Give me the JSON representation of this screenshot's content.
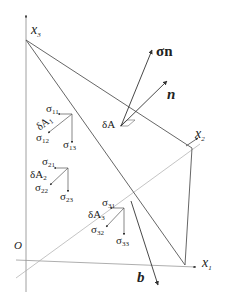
{
  "axes": {
    "x1": {
      "label": "x",
      "sub": "1"
    },
    "x2": {
      "label": "x",
      "sub": "2"
    },
    "x3": {
      "label": "x",
      "sub": "3"
    },
    "origin": "O"
  },
  "vectors": {
    "sigma_n": "σn",
    "n": "n",
    "b": "b"
  },
  "surface_element": "δA",
  "faces": [
    {
      "area": {
        "base": "δA",
        "sub": "1"
      },
      "s_a": {
        "base": "σ",
        "sub": "11"
      },
      "s_b": {
        "base": "σ",
        "sub": "12"
      },
      "s_c": {
        "base": "σ",
        "sub": "13"
      }
    },
    {
      "area": {
        "base": "δA",
        "sub": "2"
      },
      "s_a": {
        "base": "σ",
        "sub": "21"
      },
      "s_b": {
        "base": "σ",
        "sub": "22"
      },
      "s_c": {
        "base": "σ",
        "sub": "23"
      }
    },
    {
      "area": {
        "base": "δA",
        "sub": "3"
      },
      "s_a": {
        "base": "σ",
        "sub": "31"
      },
      "s_b": {
        "base": "σ",
        "sub": "32"
      },
      "s_c": {
        "base": "σ",
        "sub": "33"
      }
    }
  ],
  "colors": {
    "line": "#555555",
    "light_line": "#9a9a9a",
    "text": "#222222"
  }
}
